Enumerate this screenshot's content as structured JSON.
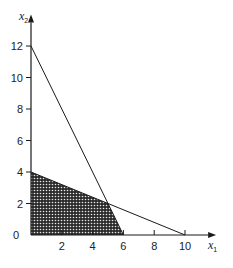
{
  "chart_data": {
    "type": "area",
    "title": "",
    "xlabel": "x",
    "xlabel_sub": "1",
    "ylabel": "x",
    "ylabel_sub": "2",
    "xlim": [
      0,
      11.5
    ],
    "ylim": [
      0,
      13.5
    ],
    "x_ticks": [
      2,
      4,
      6,
      8,
      10
    ],
    "y_ticks": [
      2,
      4,
      6,
      8,
      10,
      12
    ],
    "origin_label": "0",
    "grid": false,
    "legend": "none",
    "lines": [
      {
        "name": "constraint-1",
        "points": [
          [
            0,
            12
          ],
          [
            6,
            0
          ]
        ]
      },
      {
        "name": "constraint-2",
        "points": [
          [
            0,
            4
          ],
          [
            10,
            0
          ]
        ]
      }
    ],
    "feasible_region": {
      "name": "feasible-region",
      "fill": "crosshatch",
      "vertices": [
        [
          0,
          0
        ],
        [
          0,
          4
        ],
        [
          5,
          2
        ],
        [
          6,
          0
        ]
      ]
    }
  },
  "colors": {
    "ink": "#1a1a1a",
    "region_fill": "#2b2b2b",
    "region_dots": "#e8e8e8"
  }
}
